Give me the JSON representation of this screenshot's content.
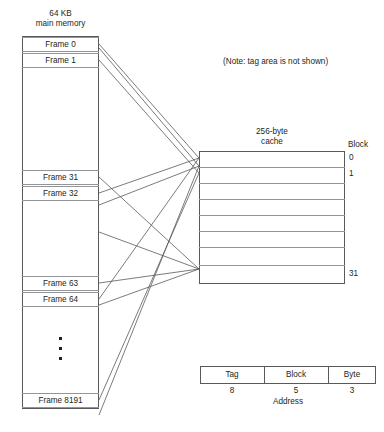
{
  "figure": {
    "note": "(Note: tag area is not shown)"
  },
  "main_memory": {
    "title_line1": "64 KB",
    "title_line2": "main memory",
    "frames": [
      {
        "label": "Frame 0",
        "top": 37
      },
      {
        "label": "Frame 1",
        "top": 53
      },
      {
        "label": "Frame 31",
        "top": 170
      },
      {
        "label": "Frame 32",
        "top": 186
      },
      {
        "label": "Frame 63",
        "top": 276
      },
      {
        "label": "Frame 64",
        "top": 292
      },
      {
        "label": "Frame 8191",
        "top": 393
      }
    ]
  },
  "cache": {
    "title_line1": "256-byte",
    "title_line2": "cache",
    "block_header": "Block",
    "block_labels": [
      {
        "text": "0",
        "top": 153
      },
      {
        "text": "1",
        "top": 169
      },
      {
        "text": "31",
        "top": 269
      }
    ],
    "row_dividers": [
      167,
      183,
      199,
      215,
      231,
      247,
      265
    ]
  },
  "address_format": {
    "caption": "Address",
    "fields": [
      {
        "name": "Tag",
        "bits": "8",
        "left": 200,
        "width": 64
      },
      {
        "name": "Block",
        "bits": "5",
        "left": 264,
        "width": 64
      },
      {
        "name": "Byte",
        "bits": "3",
        "left": 328,
        "width": 48
      }
    ]
  },
  "colors": {
    "line": "#58595b",
    "divider": "#939598",
    "text": "#231f20",
    "background": "#ffffff"
  }
}
